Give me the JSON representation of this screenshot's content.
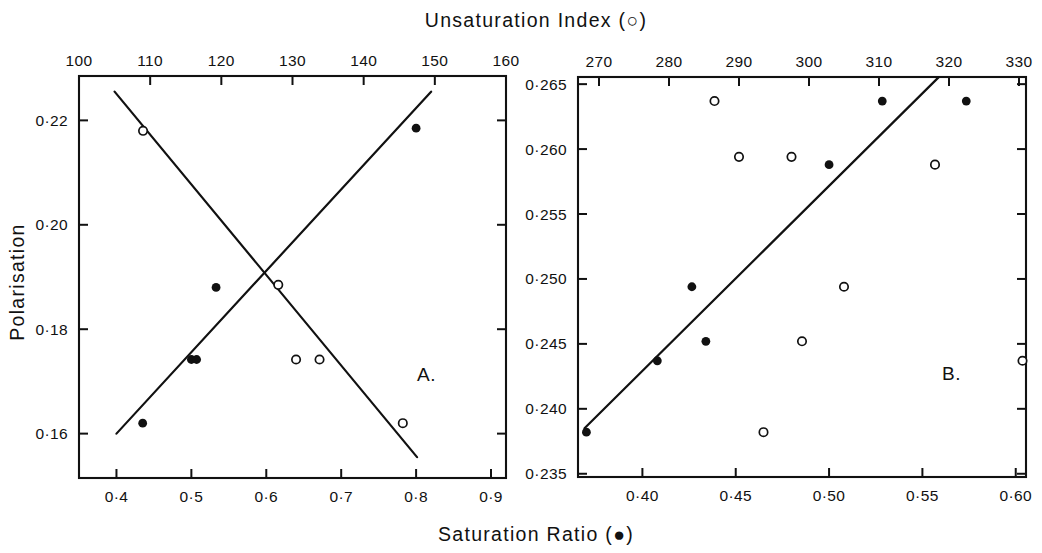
{
  "figure": {
    "top_axis_title": "Unsaturation Index (○)",
    "bottom_axis_title": "Saturation Ratio (●)",
    "left_axis_title": "Polarisation"
  },
  "panelA": {
    "letter": "A.",
    "top_ticks": [
      "100",
      "110",
      "120",
      "130",
      "140",
      "150",
      "160"
    ],
    "bottom_ticks": [
      "0·4",
      "0·5",
      "0·6",
      "0·7",
      "0·8",
      "0·9"
    ],
    "left_ticks": [
      "0·22",
      "0·20",
      "0·18",
      "0·16"
    ]
  },
  "panelB": {
    "letter": "B.",
    "top_ticks": [
      "270",
      "280",
      "290",
      "300",
      "310",
      "320",
      "330"
    ],
    "bottom_ticks": [
      "0·40",
      "0·45",
      "0·50",
      "0·55",
      "0·60"
    ],
    "left_ticks": [
      "0·265",
      "0·260",
      "0·255",
      "0·250",
      "0·245",
      "0·240",
      "0·235"
    ]
  },
  "chart_data": [
    {
      "type": "scatter",
      "panel": "A",
      "title": "",
      "xlabel": "Saturation Ratio (●)",
      "xlabel_top": "Unsaturation Index (○)",
      "ylabel": "Polarisation",
      "xlim": [
        0.35,
        0.92
      ],
      "xlim_top": [
        100,
        160
      ],
      "ylim": [
        0.1515,
        0.2285
      ],
      "xticks": [
        0.4,
        0.5,
        0.6,
        0.7,
        0.8,
        0.9
      ],
      "xticks_top": [
        100,
        110,
        120,
        130,
        140,
        150,
        160
      ],
      "yticks": [
        0.16,
        0.18,
        0.2,
        0.22
      ],
      "grid": false,
      "legend": "none",
      "series": [
        {
          "name": "Saturation Ratio (●)",
          "marker": "filled-circle",
          "axis": "bottom",
          "points": [
            {
              "x": 0.435,
              "y": 0.162
            },
            {
              "x": 0.5,
              "y": 0.1742
            },
            {
              "x": 0.507,
              "y": 0.1742
            },
            {
              "x": 0.533,
              "y": 0.188
            },
            {
              "x": 0.8,
              "y": 0.2185
            }
          ],
          "trendline": {
            "x1": 0.4,
            "y1": 0.16,
            "x2": 0.82,
            "y2": 0.2255
          }
        },
        {
          "name": "Unsaturation Index (○)",
          "marker": "open-circle",
          "axis": "top",
          "points": [
            {
              "x": 109.0,
              "y": 0.218
            },
            {
              "x": 128.0,
              "y": 0.1885
            },
            {
              "x": 130.5,
              "y": 0.1742
            },
            {
              "x": 133.8,
              "y": 0.1742
            },
            {
              "x": 145.5,
              "y": 0.162
            }
          ],
          "trendline": {
            "x1": 105.0,
            "y1": 0.2255,
            "x2": 147.5,
            "y2": 0.1555
          }
        }
      ]
    },
    {
      "type": "scatter",
      "panel": "B",
      "title": "",
      "xlabel": "Saturation Ratio (●)",
      "xlabel_top": "Unsaturation Index (○)",
      "ylabel": "Polarisation",
      "xlim": [
        0.3655,
        0.6055
      ],
      "xlim_top": [
        267.0,
        331.0
      ],
      "ylim": [
        0.23475,
        0.26555
      ],
      "xticks": [
        0.4,
        0.45,
        0.5,
        0.55,
        0.6
      ],
      "xticks_top": [
        270,
        280,
        290,
        300,
        310,
        320,
        330
      ],
      "yticks": [
        0.235,
        0.24,
        0.245,
        0.25,
        0.255,
        0.26,
        0.265
      ],
      "grid": false,
      "legend": "none",
      "series": [
        {
          "name": "Saturation Ratio (●)",
          "marker": "filled-circle",
          "axis": "bottom",
          "points": [
            {
              "x": 0.37,
              "y": 0.2382
            },
            {
              "x": 0.408,
              "y": 0.2437
            },
            {
              "x": 0.4265,
              "y": 0.2494
            },
            {
              "x": 0.434,
              "y": 0.2452
            },
            {
              "x": 0.5,
              "y": 0.2588
            },
            {
              "x": 0.5285,
              "y": 0.2637
            },
            {
              "x": 0.5735,
              "y": 0.2637
            }
          ],
          "trendline": {
            "x1": 0.369,
            "y1": 0.2385,
            "x2": 0.5585,
            "y2": 0.2655
          }
        },
        {
          "name": "Unsaturation Index (○)",
          "marker": "open-circle",
          "axis": "top",
          "points": [
            {
              "x": 286.5,
              "y": 0.2637
            },
            {
              "x": 290.0,
              "y": 0.2594
            },
            {
              "x": 297.5,
              "y": 0.2594
            },
            {
              "x": 293.5,
              "y": 0.2382
            },
            {
              "x": 305.0,
              "y": 0.2494
            },
            {
              "x": 299.0,
              "y": 0.2452
            },
            {
              "x": 318.0,
              "y": 0.2588
            },
            {
              "x": 330.5,
              "y": 0.2437
            }
          ],
          "trendline": null
        }
      ]
    }
  ]
}
